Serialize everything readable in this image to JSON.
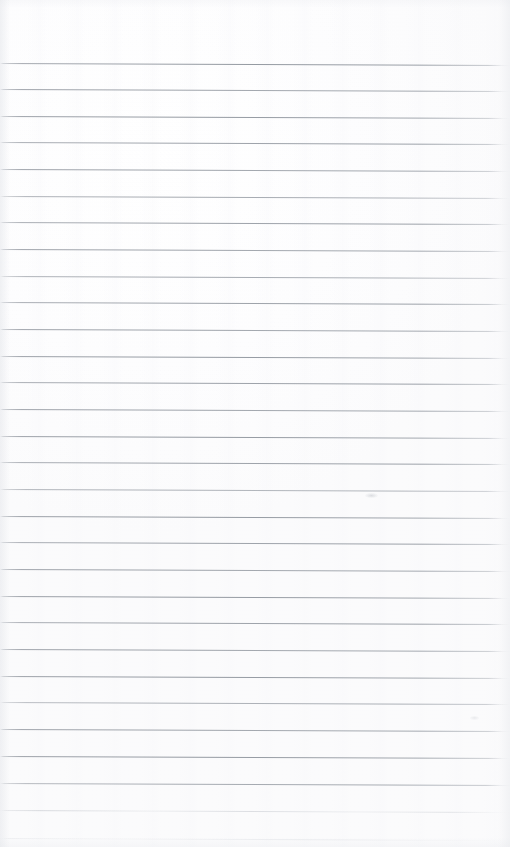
{
  "document": {
    "kind": "blank-ruled-paper-scan",
    "title": "",
    "body_text": "",
    "handwriting": "",
    "printed_text": "",
    "page_number": "",
    "header": "",
    "footer": ""
  },
  "page": {
    "width": 510,
    "height": 847,
    "background_color": "#ffffff",
    "paper_tone_color": "#fdfdfe",
    "margin_top_blank_px": 63,
    "has_vertical_margin_rule": false,
    "has_holes": false
  },
  "ruling": {
    "line_color": "#a0a5ac",
    "line_color_strong": "#8e949c",
    "line_color_faint": "#c0c4ca",
    "line_thickness_px": 1,
    "line_spacing_px": 26.7,
    "first_line_y_px": 63,
    "line_count": 29,
    "tilt_degrees": 0.22,
    "left_start_px": 2,
    "right_end_px": 502,
    "lines": [
      {
        "y": 63,
        "weight": "strong"
      },
      {
        "y": 89,
        "weight": "strong"
      },
      {
        "y": 116,
        "weight": "strong"
      },
      {
        "y": 142,
        "weight": "strong"
      },
      {
        "y": 169,
        "weight": "strong"
      },
      {
        "y": 196,
        "weight": "normal"
      },
      {
        "y": 222,
        "weight": "strong"
      },
      {
        "y": 249,
        "weight": "strong"
      },
      {
        "y": 276,
        "weight": "normal"
      },
      {
        "y": 302,
        "weight": "strong"
      },
      {
        "y": 329,
        "weight": "strong"
      },
      {
        "y": 356,
        "weight": "strong"
      },
      {
        "y": 382,
        "weight": "strong"
      },
      {
        "y": 409,
        "weight": "strong"
      },
      {
        "y": 436,
        "weight": "strong"
      },
      {
        "y": 462,
        "weight": "strong"
      },
      {
        "y": 489,
        "weight": "normal"
      },
      {
        "y": 516,
        "weight": "strong"
      },
      {
        "y": 542,
        "weight": "strong"
      },
      {
        "y": 569,
        "weight": "strong"
      },
      {
        "y": 596,
        "weight": "strong"
      },
      {
        "y": 622,
        "weight": "strong"
      },
      {
        "y": 649,
        "weight": "strong"
      },
      {
        "y": 676,
        "weight": "strong"
      },
      {
        "y": 702,
        "weight": "normal"
      },
      {
        "y": 729,
        "weight": "strong"
      },
      {
        "y": 756,
        "weight": "strong"
      },
      {
        "y": 783,
        "weight": "normal"
      },
      {
        "y": 810,
        "weight": "faint"
      },
      {
        "y": 838,
        "weight": "very-faint"
      }
    ]
  },
  "marks": [
    {
      "name": "faint-smudge",
      "x": 365,
      "y": 493,
      "w": 13,
      "h": 5
    },
    {
      "name": "faint-speck",
      "x": 470,
      "y": 716,
      "w": 9,
      "h": 4
    }
  ]
}
